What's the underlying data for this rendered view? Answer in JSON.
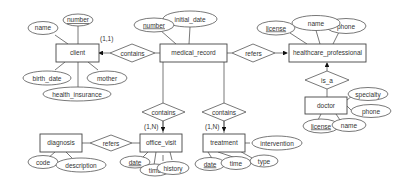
{
  "diagram": {
    "type": "entity-relationship",
    "entities": {
      "client": "client",
      "medical_record": "medical_record",
      "healthcare_professional": "healthcare_professional",
      "doctor": "doctor",
      "diagnosis": "diagnosis",
      "office_visit": "office_visit",
      "treatment": "treatment"
    },
    "attributes": {
      "client": {
        "number": "number",
        "name": "name",
        "birth_date": "birth_date",
        "mother": "mother",
        "health_insurance": "health_insurance"
      },
      "medical_record": {
        "number": "number",
        "initial_date": "initial_date"
      },
      "healthcare_professional": {
        "license": "license",
        "name": "name",
        "phone": "phone"
      },
      "doctor": {
        "specialty": "specialty",
        "phone": "phone",
        "license": "license",
        "name": "name"
      },
      "diagnosis": {
        "code": "code",
        "description": "description"
      },
      "office_visit": {
        "date": "date",
        "time": "time",
        "history": "history"
      },
      "treatment": {
        "date": "date",
        "time": "time",
        "type": "type",
        "intervention": "intervention"
      }
    },
    "relationships": {
      "contains_client": "contains",
      "refers_hp": "refers",
      "is_a": "is_a",
      "contains_visit": "contains",
      "contains_treatment": "contains",
      "refers_diagnosis": "refers"
    },
    "cardinalities": {
      "client": "(1,1)",
      "office_visit": "(1,N)",
      "treatment": "(1,N)"
    }
  }
}
